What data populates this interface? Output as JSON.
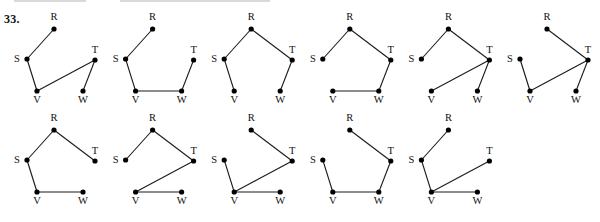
{
  "problem": {
    "number": "33."
  },
  "diagram": {
    "type": "graph-enumeration",
    "vertex_labels": [
      "R",
      "S",
      "T",
      "V",
      "W"
    ],
    "vertex_positions_relative": {
      "R": [
        54,
        29
      ],
      "S": [
        27,
        59
      ],
      "T": [
        95,
        60
      ],
      "V": [
        37,
        91
      ],
      "W": [
        83,
        91
      ]
    },
    "label_offsets": {
      "R": [
        0,
        -9
      ],
      "S": [
        -10,
        3
      ],
      "T": [
        0,
        -7
      ],
      "V": [
        0,
        12
      ],
      "W": [
        0,
        12
      ]
    },
    "graphs": [
      {
        "row": 0,
        "col": 0,
        "edges": [
          [
            "R",
            "S"
          ],
          [
            "S",
            "V"
          ],
          [
            "V",
            "T"
          ],
          [
            "T",
            "W"
          ]
        ]
      },
      {
        "row": 0,
        "col": 1,
        "edges": [
          [
            "R",
            "S"
          ],
          [
            "S",
            "V"
          ],
          [
            "V",
            "W"
          ],
          [
            "W",
            "T"
          ]
        ]
      },
      {
        "row": 0,
        "col": 2,
        "edges": [
          [
            "R",
            "S"
          ],
          [
            "R",
            "T"
          ],
          [
            "S",
            "V"
          ],
          [
            "T",
            "W"
          ]
        ]
      },
      {
        "row": 0,
        "col": 3,
        "edges": [
          [
            "R",
            "S"
          ],
          [
            "R",
            "T"
          ],
          [
            "T",
            "W"
          ],
          [
            "W",
            "V"
          ]
        ]
      },
      {
        "row": 0,
        "col": 4,
        "edges": [
          [
            "R",
            "S"
          ],
          [
            "R",
            "T"
          ],
          [
            "T",
            "V"
          ],
          [
            "T",
            "W"
          ]
        ]
      },
      {
        "row": 0,
        "col": 5,
        "edges": [
          [
            "R",
            "T"
          ],
          [
            "T",
            "V"
          ],
          [
            "T",
            "W"
          ],
          [
            "S",
            "V"
          ]
        ]
      },
      {
        "row": 1,
        "col": 0,
        "edges": [
          [
            "R",
            "S"
          ],
          [
            "R",
            "T"
          ],
          [
            "S",
            "V"
          ],
          [
            "V",
            "W"
          ]
        ]
      },
      {
        "row": 1,
        "col": 1,
        "edges": [
          [
            "R",
            "S"
          ],
          [
            "R",
            "T"
          ],
          [
            "T",
            "V"
          ],
          [
            "V",
            "W"
          ]
        ]
      },
      {
        "row": 1,
        "col": 2,
        "edges": [
          [
            "R",
            "T"
          ],
          [
            "T",
            "V"
          ],
          [
            "S",
            "V"
          ],
          [
            "V",
            "W"
          ]
        ]
      },
      {
        "row": 1,
        "col": 3,
        "edges": [
          [
            "R",
            "T"
          ],
          [
            "T",
            "W"
          ],
          [
            "W",
            "V"
          ],
          [
            "S",
            "V"
          ]
        ]
      },
      {
        "row": 1,
        "col": 4,
        "edges": [
          [
            "R",
            "S"
          ],
          [
            "S",
            "V"
          ],
          [
            "V",
            "T"
          ],
          [
            "V",
            "W"
          ]
        ]
      }
    ],
    "layout": {
      "col_spacing": 98.6,
      "row_spacing": 101,
      "origin_x": 0,
      "origin_y": 0
    }
  },
  "colors": {
    "edge": "#1a1a1a",
    "node": "#000000",
    "label": "#111111",
    "background": "#ffffff"
  }
}
